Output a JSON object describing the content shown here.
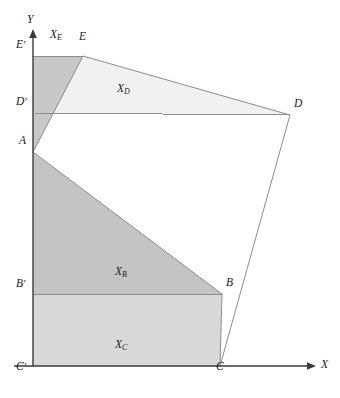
{
  "figure": {
    "background_color": "#ffffff",
    "stroke_color": "#8c8c8c"
  },
  "axes": {
    "x_label": "X",
    "y_label": "Y",
    "origin": {
      "x": 33,
      "y": 366
    },
    "x_axis": {
      "from_x": 14,
      "to_x": 315,
      "y": 366,
      "arrow": "right"
    },
    "y_axis": {
      "x": 33,
      "from_y": 366,
      "to_y": 30,
      "arrow": "up"
    }
  },
  "points": [
    {
      "id": "A",
      "label": "A",
      "x": 33,
      "y": 152,
      "label_x": 19,
      "label_y": 144
    },
    {
      "id": "B",
      "label": "B",
      "x": 222,
      "y": 294,
      "label_x": 226,
      "label_y": 286
    },
    {
      "id": "C",
      "label": "C",
      "x": 220,
      "y": 366,
      "label_x": 216,
      "label_y": 370
    },
    {
      "id": "D",
      "label": "D",
      "x": 290,
      "y": 115,
      "label_x": 294,
      "label_y": 107
    },
    {
      "id": "E",
      "label": "E",
      "x": 83,
      "y": 56,
      "label_x": 79,
      "label_y": 40
    }
  ],
  "projected_points": [
    {
      "id": "B-prime",
      "letter": "B",
      "prime": "’",
      "x": 33,
      "y": 295,
      "label_x": 16,
      "label_y": 287
    },
    {
      "id": "C-prime",
      "letter": "C",
      "prime": "’",
      "x": 33,
      "y": 366,
      "label_x": 16,
      "label_y": 370
    },
    {
      "id": "D-prime",
      "letter": "D",
      "prime": "’",
      "x": 33,
      "y": 113,
      "label_x": 16,
      "label_y": 105
    },
    {
      "id": "E-prime",
      "letter": "E",
      "prime": "’",
      "x": 33,
      "y": 56,
      "label_x": 16,
      "label_y": 48
    }
  ],
  "regions": [
    {
      "id": "XE",
      "label_letter": "X",
      "label_sub": "E",
      "label_x": 50,
      "label_y": 38,
      "fill": "#c8c8c8",
      "polygon": "33,56 83,56 33,152",
      "description": "trapezoid-region-X-sub-E"
    },
    {
      "id": "XD",
      "label_letter": "X",
      "label_sub": "D",
      "label_x": 117,
      "label_y": 92,
      "fill": "#f1f1f1",
      "polygon": "83,56 290,115 33,113 33,56",
      "description": "trapezoid-region-X-sub-D"
    },
    {
      "id": "XB",
      "label_letter": "X",
      "label_sub": "B",
      "label_x": 115,
      "label_y": 275,
      "fill": "#c4c4c4",
      "polygon": "33,152 222,294 33,295",
      "description": "trapezoid-region-X-sub-B"
    },
    {
      "id": "XC",
      "label_letter": "X",
      "label_sub": "C",
      "label_x": 115,
      "label_y": 348,
      "fill": "#d9d9d9",
      "polygon": "33,295 222,294 220,366 33,366",
      "description": "trapezoid-region-X-sub-C"
    }
  ],
  "polygon_outline": {
    "id": "main-polygon",
    "vertices": "33,152 83,56 290,115 220,366 222,294",
    "edges": [
      {
        "id": "edge-A-E",
        "from": "A",
        "to": "E"
      },
      {
        "id": "edge-E-D",
        "from": "E",
        "to": "D"
      },
      {
        "id": "edge-D-C",
        "from": "D",
        "to": "C"
      },
      {
        "id": "edge-C-B",
        "from": "C",
        "to": "B"
      },
      {
        "id": "edge-B-A",
        "from": "B",
        "to": "A"
      }
    ]
  },
  "projection_lines": [
    {
      "id": "proj-E",
      "from_x": 33,
      "from_y": 56,
      "to_x": 83,
      "to_y": 56
    },
    {
      "id": "proj-D",
      "from_x": 33,
      "from_y": 113,
      "to_x": 290,
      "to_y": 115
    },
    {
      "id": "proj-B",
      "from_x": 33,
      "from_y": 295,
      "to_x": 222,
      "to_y": 294
    },
    {
      "id": "proj-C",
      "from_x": 33,
      "from_y": 366,
      "to_x": 220,
      "to_y": 366
    }
  ]
}
